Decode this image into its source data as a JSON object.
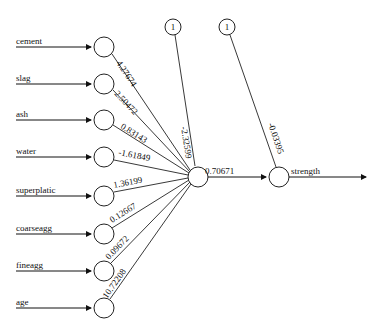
{
  "diagram": {
    "type": "neural-network",
    "inputs": [
      {
        "label": "cement",
        "weight": "4.27674"
      },
      {
        "label": "slag",
        "weight": "2.50472"
      },
      {
        "label": "ash",
        "weight": "0.83143"
      },
      {
        "label": "water",
        "weight": "-1.61849"
      },
      {
        "label": "superplatic",
        "weight": "1.36199"
      },
      {
        "label": "coarseagg",
        "weight": "0.12667"
      },
      {
        "label": "fineagg",
        "weight": "0.09672"
      },
      {
        "label": "age",
        "weight": "10.72208"
      }
    ],
    "bias_hidden": {
      "label": "1",
      "weight": "-2.32599"
    },
    "bias_output": {
      "label": "1",
      "weight": "-0.03395"
    },
    "hidden_to_output_weight": "0.70671",
    "output": {
      "label": "strength"
    }
  }
}
